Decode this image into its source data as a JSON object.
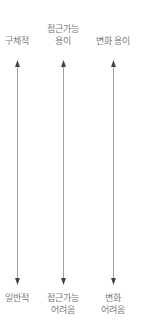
{
  "columns": [
    {
      "top": "구체적",
      "bottom": "일반적",
      "x": 17
    },
    {
      "top_line1": "접근가능",
      "top_line2": "용이",
      "bottom_line1": "접근가능",
      "bottom_line2": "어려움",
      "x": 63
    },
    {
      "top": "변화 용이",
      "bottom_line1": "변화",
      "bottom_line2": "어려움",
      "x": 113
    }
  ],
  "colors": {
    "line": "#999999",
    "arrow": "#444444",
    "text": "#7a7a7a"
  }
}
